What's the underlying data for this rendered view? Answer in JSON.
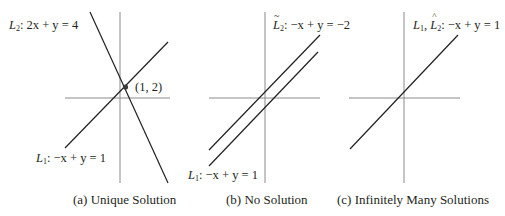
{
  "panels": [
    {
      "id": "a",
      "caption": "(a) Unique Solution",
      "lines": [
        {
          "name": "L_2",
          "label_var": "L",
          "label_sub": "2",
          "equation": ": 2x + y = 4"
        },
        {
          "name": "L_1",
          "label_var": "L",
          "label_sub": "1",
          "equation": ": −x + y = 1"
        }
      ],
      "point_label": "(1, 2)"
    },
    {
      "id": "b",
      "caption": "(b) No Solution",
      "lines": [
        {
          "name": "L~_2",
          "label_var": "L",
          "label_accent": "~",
          "label_sub": "2",
          "equation": ": −x + y = −2"
        },
        {
          "name": "L_1",
          "label_var": "L",
          "label_sub": "1",
          "equation": ": −x + y = 1"
        }
      ]
    },
    {
      "id": "c",
      "caption": "(c) Infinitely Many Solutions",
      "lines": [
        {
          "name": "L_1, L^_2",
          "label_var": "L",
          "label_sub": "1",
          "label_sep": ", ",
          "label_var2": "L",
          "label_accent2": "^",
          "label_sub2": "2",
          "equation": ": −x + y = 1"
        }
      ]
    }
  ],
  "colors": {
    "axis": "#8a8a8a",
    "line": "#231f20",
    "text": "#231f20"
  }
}
